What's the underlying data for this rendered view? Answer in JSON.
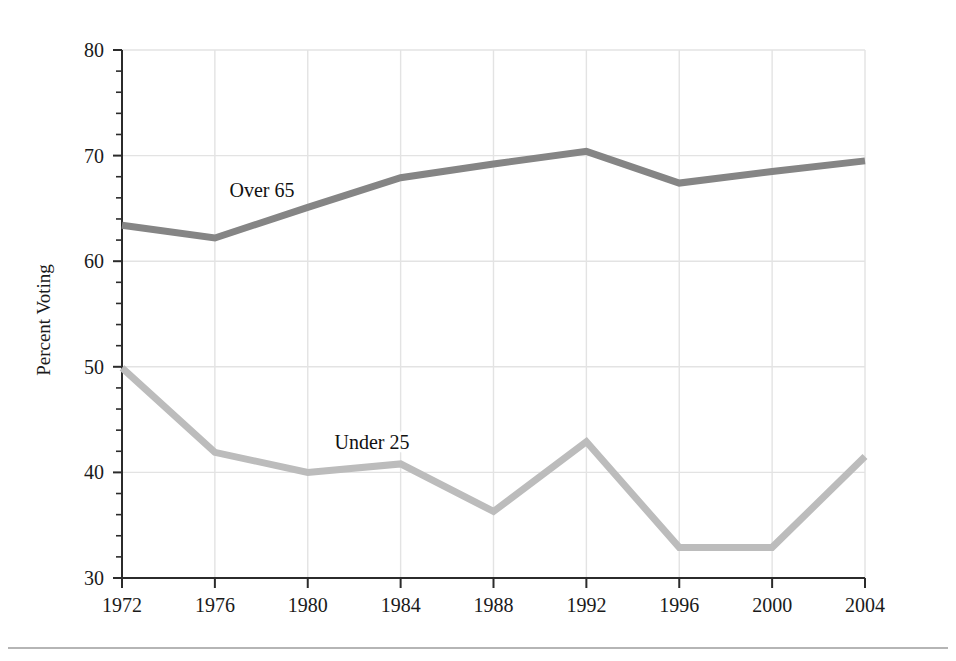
{
  "chart_data": {
    "type": "line",
    "title": "",
    "xlabel": "",
    "ylabel": "Percent Voting",
    "x": [
      1972,
      1976,
      1980,
      1984,
      1988,
      1992,
      1996,
      2000,
      2004
    ],
    "xtick_labels": [
      "1972",
      "1976",
      "1980",
      "1984",
      "1988",
      "1992",
      "1996",
      "2000",
      "2004"
    ],
    "ytick_labels": [
      "30",
      "40",
      "50",
      "60",
      "70",
      "80"
    ],
    "yticks": [
      30,
      40,
      50,
      60,
      70,
      80
    ],
    "ylim": [
      30,
      80
    ],
    "xlim": [
      1972,
      2004
    ],
    "y_minor_tick_step": 2,
    "grid": "both-major",
    "legend_position": "inline-annotation",
    "series": [
      {
        "name": "Over 65",
        "color": "#858585",
        "label_text": "Over 65",
        "values": [
          63.4,
          62.2,
          65.1,
          67.9,
          69.2,
          70.4,
          67.4,
          68.5,
          69.5
        ]
      },
      {
        "name": "Under 25",
        "color": "#bcbcbc",
        "label_text": "Under 25",
        "values": [
          49.9,
          41.9,
          40.0,
          40.8,
          36.3,
          42.9,
          32.9,
          32.9,
          41.5
        ]
      }
    ]
  },
  "figure": {
    "background_color": "#ffffff",
    "gridline_color": "#e3e3e3",
    "axis_color": "#2b2b2b",
    "bottom_rule_color": "#b5b5b5"
  }
}
